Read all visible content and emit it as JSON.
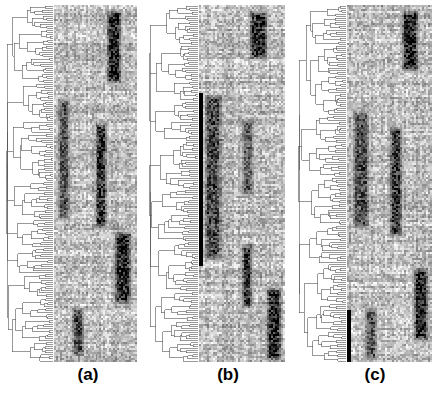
{
  "figure": {
    "background_color": "#ffffff",
    "panel_count": 3
  },
  "panels": [
    {
      "id": "a",
      "label": "(a)",
      "x": 5,
      "y": 5,
      "width": 132,
      "height": 357,
      "dendrogram_width_fraction": 0.37,
      "heatmap_width_fraction": 0.63,
      "rows": 178,
      "columns": 42
    },
    {
      "id": "b",
      "label": "(b)",
      "x": 148,
      "y": 5,
      "width": 137,
      "height": 357,
      "dendrogram_width_fraction": 0.37,
      "heatmap_width_fraction": 0.63,
      "rows": 178,
      "columns": 42
    },
    {
      "id": "c",
      "label": "(c)",
      "x": 297,
      "y": 5,
      "width": 135,
      "height": 357,
      "dendrogram_width_fraction": 0.37,
      "heatmap_width_fraction": 0.63,
      "rows": 178,
      "columns": 42
    }
  ],
  "colors": {
    "background": "#ffffff",
    "line": "#555555",
    "heatmap_low": "#ffffff",
    "heatmap_high": "#000000",
    "label_text": "#000000"
  },
  "chart_data": {
    "type": "heatmap",
    "title": "",
    "xlabel": "",
    "ylabel": "",
    "grid": false,
    "legend_position": "none",
    "colormap": "grayscale_white_to_black",
    "value_range": [
      0,
      1
    ],
    "annotations": [
      "(a)",
      "(b)",
      "(c)"
    ],
    "panels": [
      {
        "name": "(a)",
        "rows": 178,
        "columns": 42,
        "dendrogram": {
          "orientation": "left",
          "leaf_count": 178,
          "linkage": "average",
          "root_x_fraction": 0.04
        },
        "dark_blocks": [
          {
            "row_start": 2,
            "row_end": 40,
            "col_start": 26,
            "col_end": 35,
            "intensity": 0.88
          },
          {
            "row_start": 46,
            "row_end": 108,
            "col_start": 1,
            "col_end": 9,
            "intensity": 0.62
          },
          {
            "row_start": 58,
            "row_end": 112,
            "col_start": 20,
            "col_end": 28,
            "intensity": 0.8
          },
          {
            "row_start": 112,
            "row_end": 150,
            "col_start": 30,
            "col_end": 40,
            "intensity": 0.84
          },
          {
            "row_start": 150,
            "row_end": 176,
            "col_start": 8,
            "col_end": 16,
            "intensity": 0.7
          }
        ],
        "base_noise": 0.12
      },
      {
        "name": "(b)",
        "rows": 178,
        "columns": 42,
        "dendrogram": {
          "orientation": "left",
          "leaf_count": 178,
          "linkage": "average",
          "root_x_fraction": 0.04
        },
        "solid_bar": {
          "col_start": 0,
          "col_end": 2,
          "row_start": 44,
          "row_end": 130,
          "intensity": 1.0
        },
        "dark_blocks": [
          {
            "row_start": 2,
            "row_end": 28,
            "col_start": 24,
            "col_end": 34,
            "intensity": 0.82
          },
          {
            "row_start": 44,
            "row_end": 128,
            "col_start": 2,
            "col_end": 12,
            "intensity": 0.7
          },
          {
            "row_start": 56,
            "row_end": 96,
            "col_start": 20,
            "col_end": 28,
            "intensity": 0.6
          },
          {
            "row_start": 118,
            "row_end": 152,
            "col_start": 20,
            "col_end": 27,
            "intensity": 0.8
          },
          {
            "row_start": 140,
            "row_end": 178,
            "col_start": 32,
            "col_end": 41,
            "intensity": 0.86
          }
        ],
        "base_noise": 0.12
      },
      {
        "name": "(c)",
        "rows": 178,
        "columns": 42,
        "dendrogram": {
          "orientation": "left",
          "leaf_count": 178,
          "linkage": "average",
          "root_x_fraction": 0.04
        },
        "solid_bar": {
          "col_start": 0,
          "col_end": 2,
          "row_start": 152,
          "row_end": 250,
          "intensity": 1.0
        },
        "dark_blocks": [
          {
            "row_start": 2,
            "row_end": 34,
            "col_start": 26,
            "col_end": 36,
            "intensity": 0.86
          },
          {
            "row_start": 52,
            "row_end": 112,
            "col_start": 2,
            "col_end": 12,
            "intensity": 0.66
          },
          {
            "row_start": 60,
            "row_end": 116,
            "col_start": 20,
            "col_end": 28,
            "intensity": 0.78
          },
          {
            "row_start": 130,
            "row_end": 168,
            "col_start": 32,
            "col_end": 41,
            "intensity": 0.84
          },
          {
            "row_start": 150,
            "row_end": 178,
            "col_start": 8,
            "col_end": 16,
            "intensity": 0.64
          }
        ],
        "base_noise": 0.12
      }
    ]
  }
}
